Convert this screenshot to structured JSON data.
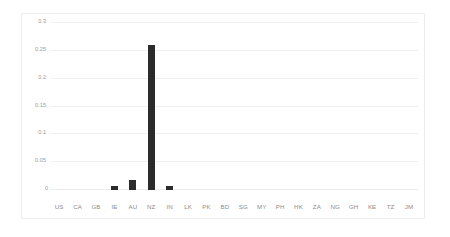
{
  "chart_data": {
    "type": "bar",
    "title": "",
    "subtitle": "",
    "xlabel": "",
    "ylabel": "",
    "categories": [
      "US",
      "CA",
      "GB",
      "IE",
      "AU",
      "NZ",
      "IN",
      "LK",
      "PK",
      "BD",
      "SG",
      "MY",
      "PH",
      "HK",
      "ZA",
      "NG",
      "GH",
      "KE",
      "TZ",
      "JM"
    ],
    "values": [
      0,
      0,
      0,
      0.008,
      0.018,
      0.26,
      0.008,
      0,
      0,
      0,
      0,
      0,
      0,
      0,
      0,
      0,
      0,
      0,
      0,
      0
    ],
    "series": [
      {
        "name": "value",
        "values": [
          0,
          0,
          0,
          0.008,
          0.018,
          0.26,
          0.008,
          0,
          0,
          0,
          0,
          0,
          0,
          0,
          0,
          0,
          0,
          0,
          0,
          0
        ]
      }
    ],
    "ylim": [
      0,
      0.3
    ],
    "yticks": [
      0,
      0.05,
      0.1,
      0.15,
      0.2,
      0.25,
      0.3
    ],
    "ytick_labels": [
      "0",
      "0.05",
      "0.1",
      "0.15",
      "0.2",
      "0.25",
      "0.3"
    ],
    "grid": true,
    "grid_axis": "y",
    "legend": false,
    "legend_position": "none",
    "annotations": [],
    "bar_color": "#2b2b2b",
    "gridline_color": "#f1f1f1",
    "tick_label_color": "#9a9a9a",
    "border_color": "#ededed",
    "background_color": "#ffffff"
  }
}
